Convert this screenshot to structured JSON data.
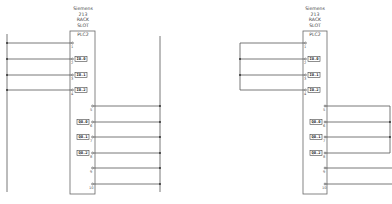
{
  "diagrams": [
    {
      "id": "left",
      "header": {
        "vendor": "Siemens",
        "model": "213",
        "rack": "RACK",
        "slot": "SLOT",
        "name": "PLC2"
      },
      "inputs": [
        {
          "pin": "1",
          "tag": ""
        },
        {
          "pin": "2",
          "tag": "I0.0"
        },
        {
          "pin": "3",
          "tag": "I0.1"
        },
        {
          "pin": "4",
          "tag": "I0.2"
        }
      ],
      "outputs": [
        {
          "pin": "5",
          "tag": ""
        },
        {
          "pin": "6",
          "tag": "Q0.0"
        },
        {
          "pin": "7",
          "tag": "Q0.1"
        },
        {
          "pin": "8",
          "tag": "Q0.2"
        },
        {
          "pin": "9",
          "tag": ""
        },
        {
          "pin": "10",
          "tag": ""
        }
      ]
    },
    {
      "id": "right",
      "header": {
        "vendor": "Siemens",
        "model": "213",
        "rack": "RACK",
        "slot": "SLOT",
        "name": "PLC2"
      },
      "inputs": [
        {
          "pin": "1",
          "tag": ""
        },
        {
          "pin": "2",
          "tag": "I0.0"
        },
        {
          "pin": "3",
          "tag": "I0.1"
        },
        {
          "pin": "4",
          "tag": "I0.2"
        }
      ],
      "outputs": [
        {
          "pin": "5",
          "tag": ""
        },
        {
          "pin": "6",
          "tag": "Q0.0"
        },
        {
          "pin": "7",
          "tag": "Q0.1"
        },
        {
          "pin": "8",
          "tag": "Q0.2"
        },
        {
          "pin": "9",
          "tag": ""
        },
        {
          "pin": "10",
          "tag": ""
        }
      ]
    }
  ],
  "colors": {
    "line": "#555555",
    "box": "#666666",
    "dot": "#333333",
    "background": "#ffffff"
  }
}
